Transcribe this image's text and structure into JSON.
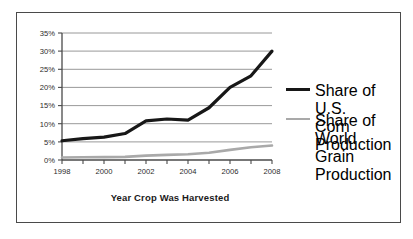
{
  "chart_data": {
    "type": "line",
    "title": "",
    "xlabel": "Year Crop Was Harvested",
    "ylabel": "",
    "xlim": [
      1998,
      2008
    ],
    "ylim": [
      0,
      35
    ],
    "grid": "horizontal",
    "legend_position": "right",
    "x": [
      1998,
      1999,
      2000,
      2001,
      2002,
      2003,
      2004,
      2005,
      2006,
      2007,
      2008
    ],
    "xticklabels": [
      "1998",
      "",
      "2000",
      "",
      "2002",
      "",
      "2004",
      "",
      "2006",
      "",
      "2008"
    ],
    "xtick_years": [
      1998,
      1999,
      2000,
      2001,
      2002,
      2003,
      2004,
      2005,
      2006,
      2007,
      2008
    ],
    "xtick_labeled": [
      "1998",
      "2000",
      "2002",
      "2004",
      "2006",
      "2008"
    ],
    "yticks": [
      0,
      5,
      10,
      15,
      20,
      25,
      30,
      35
    ],
    "yticklabels": [
      "0%",
      "5%",
      "10%",
      "15%",
      "20%",
      "25%",
      "30%",
      "35%"
    ],
    "series": [
      {
        "name": "Share of U.S. Corn Production",
        "color": "#171717",
        "linewidth": 3.2,
        "values": [
          5.3,
          5.9,
          6.3,
          7.3,
          10.8,
          11.3,
          11.0,
          14.4,
          20.0,
          23.2,
          30.0
        ]
      },
      {
        "name": "Share of World Grain Production",
        "color": "#a9a9a9",
        "linewidth": 2.6,
        "values": [
          0.7,
          0.75,
          0.8,
          0.85,
          1.2,
          1.4,
          1.6,
          2.0,
          2.8,
          3.5,
          4.0
        ]
      }
    ]
  },
  "axis": {
    "x_title": "Year Crop Was Harvested",
    "y_tick_labels": [
      "35%",
      "30%",
      "25%",
      "20%",
      "15%",
      "10%",
      "5%",
      "0%"
    ],
    "x_tick_labels": [
      "1998",
      "2000",
      "2002",
      "2004",
      "2006",
      "2008"
    ]
  },
  "legend": {
    "entries": [
      {
        "label_line1": "Share of U.S.",
        "label_line2": "Corn Production",
        "color": "#171717"
      },
      {
        "label_line1": "Share of World",
        "label_line2": "Grain Production",
        "color": "#a9a9a9"
      }
    ]
  }
}
